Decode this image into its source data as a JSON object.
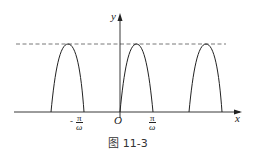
{
  "figure": {
    "caption": "图 11-3",
    "axes": {
      "x_label": "x",
      "y_label": "y",
      "origin_label": "O"
    },
    "tick_labels": [
      {
        "sign": "-",
        "numerator": "π",
        "denominator": "ω"
      },
      {
        "sign": "",
        "numerator": "π",
        "denominator": "ω"
      }
    ],
    "curve": "periodic arches (|A sin ωx| shape on alternating half-periods), peaks touching dashed max line",
    "dashed_line": "maximum value level",
    "colors": {
      "stroke": "#222222",
      "dashed": "#555555"
    }
  }
}
